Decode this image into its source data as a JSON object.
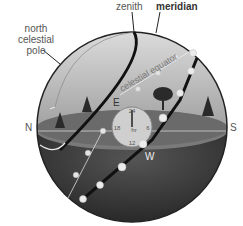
{
  "labels": {
    "zenith": "zenith",
    "meridian": "meridian",
    "north_celestial_pole": [
      "north",
      "celestial",
      "pole"
    ],
    "celestial_equator": "celestial equator",
    "north": "N",
    "south": "S",
    "east": "E",
    "west": "W"
  },
  "clock": {
    "top": "24",
    "left": "18",
    "right": "6",
    "bottom": "12",
    "unit": "hr"
  },
  "colors": {
    "sky_upper": "#d4d4d4",
    "sky_lower": "#a8a8a8",
    "ground": "#6e6e6e",
    "below_horizon": "#2e2e2e",
    "sun_dot": "#e8e8e8",
    "outline": "#222222"
  }
}
